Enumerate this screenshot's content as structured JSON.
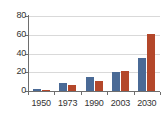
{
  "chart_data": {
    "type": "bar",
    "title": "",
    "xlabel": "",
    "ylabel": "",
    "categories": [
      "1950",
      "1973",
      "1990",
      "2003",
      "2030"
    ],
    "series": [
      {
        "name": "Series 1",
        "color": "#4a6a96",
        "values": [
          2,
          9,
          15,
          20,
          35
        ]
      },
      {
        "name": "Series 2",
        "color": "#b4472a",
        "values": [
          1,
          6,
          11,
          21,
          61
        ]
      }
    ],
    "ylim": [
      0,
      80
    ],
    "yticks": [
      0,
      20,
      40,
      60,
      80
    ],
    "ytick_labels": [
      "0",
      "20",
      "40",
      "60",
      "80"
    ],
    "grid": true,
    "legend": "none",
    "axis_color": "#6e6e6e",
    "grid_color": "#d9d9d9",
    "background": "#ffffff"
  }
}
